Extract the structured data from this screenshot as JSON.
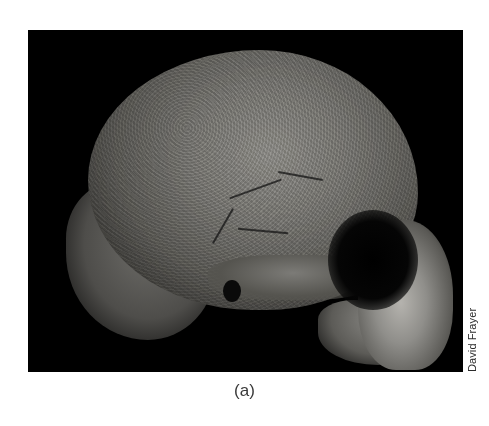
{
  "figure": {
    "image_alt": "Lateral view of a fossil hominin skull on a black background",
    "credit": "David Frayer",
    "caption": "(a)",
    "background_color": "#000000"
  }
}
